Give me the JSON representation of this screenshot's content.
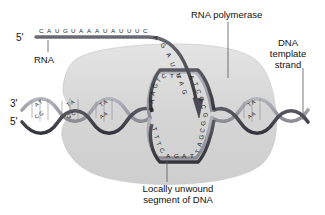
{
  "figure": {
    "background_color": "#ffffff"
  },
  "colors": {
    "polymerase_fill": "#d8d8d8",
    "polymerase_stroke": "#c4c4c4",
    "rna_strand": "#4a4a52",
    "dna_dark_strand": "#3c3c44",
    "dna_light_strand": "#9a9aa2",
    "text": "#111111",
    "leader_line": "#555555"
  },
  "labels": {
    "rna_polymerase": "RNA polymerase",
    "dna_template_strand_line1": "DNA",
    "dna_template_strand_line2": "template",
    "dna_template_strand_line3": "strand",
    "rna": "RNA",
    "locally_unwound_line1": "Locally unwound",
    "locally_unwound_line2": "segment of DNA"
  },
  "end_labels": {
    "rna_five_prime": "5'",
    "dna_three_prime": "3'",
    "dna_five_prime": "5'"
  },
  "sequences": {
    "rna_horizontal": [
      "C",
      "A",
      "U",
      "G",
      "U",
      "A",
      "A",
      "A",
      "U",
      "A",
      "U",
      "U",
      "U",
      "C"
    ],
    "rna_curve_down": [
      "A",
      "G",
      "A",
      "U"
    ],
    "rna_in_bubble": [
      "U",
      "A",
      "G"
    ],
    "bubble_top_left": [
      "A",
      "A",
      "A",
      "G",
      "T",
      "C"
    ],
    "bubble_top_right": [
      "T",
      "A"
    ],
    "bubble_right_up": [
      "A",
      "T",
      "C",
      "G",
      "C",
      "G"
    ],
    "bubble_bottom": [
      "A",
      "G",
      "A",
      "T"
    ],
    "bubble_bottom_left": [
      "T",
      "T",
      "T",
      "C"
    ],
    "bubble_bottom_right": [
      "T",
      "A",
      "G",
      "C",
      "G"
    ],
    "helix_left_pairs": [
      {
        "top": "A T",
        "bottom": "C G"
      },
      {
        "top": "T A",
        "bottom": "G C"
      },
      {
        "top": "T A",
        "bottom": "A A"
      }
    ],
    "helix_right_pairs": [
      {
        "top": "T A",
        "bottom": "A A"
      }
    ]
  },
  "icon_names": {
    "arrow": "transcription-direction-arrow",
    "helix": "dna-double-helix",
    "enzyme": "rna-polymerase-blob"
  }
}
